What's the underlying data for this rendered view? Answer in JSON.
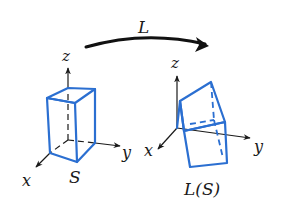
{
  "diagram": {
    "transform_label": "L",
    "colors": {
      "box": "#2b6fd1",
      "axis": "#1a1a1a",
      "background": "#ffffff"
    },
    "left_figure": {
      "axes": {
        "x": "x",
        "y": "y",
        "z": "z"
      },
      "shape_label": "S",
      "shape": "rectangular box (upright)"
    },
    "right_figure": {
      "axes": {
        "x": "x",
        "y": "y",
        "z": "z"
      },
      "shape_label": "L(S)",
      "shape": "rotated rectangular box"
    },
    "arrow": {
      "direction": "left-to-right",
      "meaning": "linear transformation L maps S to L(S)"
    }
  }
}
